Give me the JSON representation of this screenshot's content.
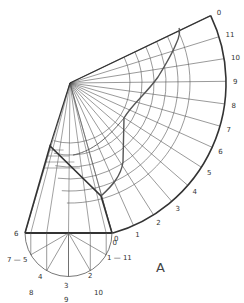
{
  "figure": {
    "label": "A",
    "colors": {
      "stroke_thin": "#555555",
      "stroke_thick": "#333333",
      "curve": "#555555",
      "text": "#333333",
      "background": "#ffffff"
    },
    "apex": [
      70,
      83
    ],
    "development": {
      "radius": 156,
      "start_angle_deg": 74.3,
      "end_angle_deg": -25.6,
      "divisions": 12,
      "arc_labels": [
        "0",
        "1",
        "2",
        "3",
        "4",
        "5",
        "6",
        "7",
        "8",
        "9",
        "10",
        "11",
        "0"
      ],
      "inner_arc_radii": [
        60,
        72,
        84,
        96,
        108,
        120
      ]
    },
    "frustum": {
      "base_left": [
        25,
        233
      ],
      "base_right": [
        112,
        233
      ],
      "top_left": [
        50,
        146
      ],
      "cut_right": [
        101,
        196
      ]
    },
    "base_semicircle": {
      "center": [
        68.5,
        233
      ],
      "radius": 43.5,
      "point_labels": [
        {
          "text": "6",
          "x": 14,
          "y": 236
        },
        {
          "text": "0",
          "x": 114,
          "y": 241
        },
        {
          "text": "7 — 5",
          "x": 7,
          "y": 262
        },
        {
          "text": "1 — 11",
          "x": 107,
          "y": 260
        },
        {
          "text": "4",
          "x": 38,
          "y": 279
        },
        {
          "text": "8",
          "x": 29,
          "y": 295
        },
        {
          "text": "3",
          "x": 64,
          "y": 288
        },
        {
          "text": "9",
          "x": 64,
          "y": 302
        },
        {
          "text": "2",
          "x": 88,
          "y": 278
        },
        {
          "text": "10",
          "x": 94,
          "y": 295
        }
      ]
    }
  }
}
